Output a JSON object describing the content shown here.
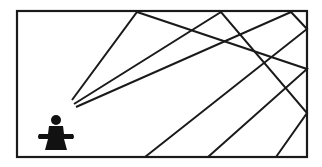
{
  "diagram": {
    "colors": {
      "background": "#ffffff",
      "stroke": "#1a1a1a",
      "figure": "#111111"
    },
    "room": {
      "x": 17,
      "y": 11,
      "width": 290,
      "height": 146,
      "stroke_width": 2.2
    },
    "figure": {
      "label": "person",
      "head": {
        "cx": 56,
        "cy": 120,
        "r": 5
      },
      "body_path": "M49,126 L63,126 L64,134 L73,134 Q75,137 73,139 L64,139 L67,150 L45,150 L48,139 L39,139 Q37,137 39,134 L48,134 Z"
    },
    "rays": [
      {
        "name": "ray-a",
        "points": [
          [
            72,
            100
          ],
          [
            137,
            12
          ],
          [
            307,
            69
          ],
          [
            208,
            157
          ]
        ]
      },
      {
        "name": "ray-b",
        "points": [
          [
            74,
            104
          ],
          [
            221,
            12
          ],
          [
            307,
            113
          ],
          [
            276,
            157
          ]
        ]
      },
      {
        "name": "ray-c",
        "points": [
          [
            76,
            107
          ],
          [
            291,
            12
          ],
          [
            307,
            29
          ],
          [
            145,
            157
          ]
        ]
      }
    ],
    "ray_stroke_width": 2
  }
}
